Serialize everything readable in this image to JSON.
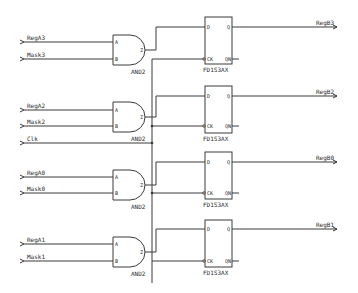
{
  "diagram": {
    "type": "schematic",
    "inputs": [
      {
        "label": "RegA3",
        "y": 42
      },
      {
        "label": "Mask3",
        "y": 59
      },
      {
        "label": "RegA2",
        "y": 110
      },
      {
        "label": "Mask2",
        "y": 126
      },
      {
        "label": "Clk",
        "y": 143
      },
      {
        "label": "RegA0",
        "y": 177
      },
      {
        "label": "Mask0",
        "y": 193
      },
      {
        "label": "RegA1",
        "y": 244
      },
      {
        "label": "Mask1",
        "y": 261
      }
    ],
    "and_gates": [
      {
        "type_label": "AND2",
        "pin_a": "A",
        "pin_b": "B",
        "pin_out": "Z",
        "top": 35
      },
      {
        "type_label": "AND2",
        "pin_a": "A",
        "pin_b": "B",
        "pin_out": "Z",
        "top": 102
      },
      {
        "type_label": "AND2",
        "pin_a": "A",
        "pin_b": "B",
        "pin_out": "Z",
        "top": 170
      },
      {
        "type_label": "AND2",
        "pin_a": "A",
        "pin_b": "B",
        "pin_out": "Z",
        "top": 237
      }
    ],
    "flip_flops": [
      {
        "type_label": "FD1S3AX",
        "pin_d": "D",
        "pin_q": "Q",
        "pin_ck": "CK",
        "pin_qn": "QN",
        "top": 17
      },
      {
        "type_label": "FD1S3AX",
        "pin_d": "D",
        "pin_q": "Q",
        "pin_ck": "CK",
        "pin_qn": "QN",
        "top": 86
      },
      {
        "type_label": "FD1S3AX",
        "pin_d": "D",
        "pin_q": "Q",
        "pin_ck": "CK",
        "pin_qn": "QN",
        "top": 152
      },
      {
        "type_label": "FD1S3AX",
        "pin_d": "D",
        "pin_q": "Q",
        "pin_ck": "CK",
        "pin_qn": "QN",
        "top": 220
      }
    ],
    "outputs": [
      {
        "label": "RegB3",
        "y": 27
      },
      {
        "label": "RegB2",
        "y": 96
      },
      {
        "label": "RegB0",
        "y": 162
      },
      {
        "label": "RegB1",
        "y": 229
      }
    ],
    "colors": {
      "wire": "#3a3a3a",
      "background": "#ffffff"
    }
  }
}
